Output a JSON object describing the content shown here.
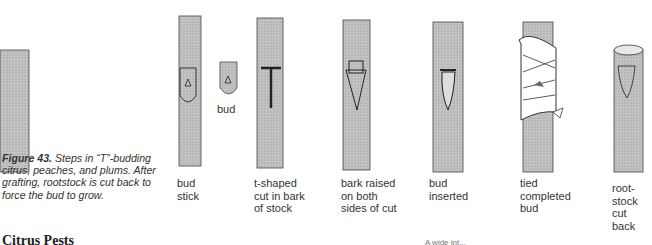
{
  "figure": {
    "number_label": "Figure 43.",
    "caption_text": " Steps in “T”-budding citrus, peaches, and plums. After grafting, rootstock is cut back to force the bud to grow.",
    "steps": [
      {
        "id": "bud-stick",
        "label": "bud\nstick"
      },
      {
        "id": "bud",
        "label": "bud"
      },
      {
        "id": "t-cut",
        "label": "t-shaped\ncut in bark\nof stock"
      },
      {
        "id": "bark-raised",
        "label": "bark raised\non both\nsides of cut"
      },
      {
        "id": "bud-inserted",
        "label": "bud\ninserted"
      },
      {
        "id": "tied",
        "label": "tied\ncompleted\nbud"
      },
      {
        "id": "cut-back",
        "label": "root-\nstock\ncut\nback"
      }
    ]
  },
  "section": {
    "heading": "Citrus Pests",
    "truncated_text": "A wide int..."
  },
  "colors": {
    "bark": "#b8b8b8",
    "outline": "#333333",
    "text": "#333333"
  }
}
